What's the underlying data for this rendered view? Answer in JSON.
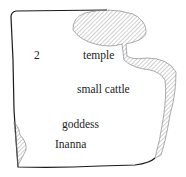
{
  "diagram": {
    "type": "tablet-drawing",
    "labels": {
      "number": "2",
      "temple": "temple",
      "small_cattle": "small cattle",
      "goddess": "goddess",
      "inanna": "Inanna"
    },
    "colors": {
      "outline": "#1a1a1a",
      "hatch": "#8a8a8a",
      "text": "#222222",
      "background": "#ffffff"
    }
  }
}
